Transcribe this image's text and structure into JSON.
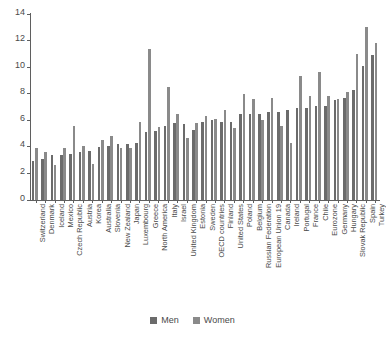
{
  "chart_data": {
    "type": "bar",
    "title": "",
    "subtitle": "",
    "xlabel": "",
    "ylabel": "",
    "ylim": [
      0,
      14
    ],
    "yticks": [
      0,
      2,
      4,
      6,
      8,
      10,
      12,
      14
    ],
    "grid": false,
    "legend_position": "bottom",
    "categories": [
      "Switzerland",
      "Denmark",
      "Iceland",
      "Mexico",
      "Czech Republic",
      "Austria",
      "Korea",
      "Australia",
      "Slovenia",
      "New Zealand",
      "Japan",
      "Luxembourg",
      "Greece",
      "North America",
      "Italy",
      "Israel",
      "United Kingdom",
      "Estonia",
      "Sweden",
      "OECD countries",
      "Finland",
      "United States",
      "Poland",
      "Belgium",
      "Russian Federation",
      "European Union 19",
      "Canada",
      "Ireland",
      "Portugal",
      "France",
      "Chile",
      "Eurozone",
      "Germany",
      "Hungary",
      "Slovak Republic",
      "Spain",
      "Turkey"
    ],
    "series": [
      {
        "name": "Men",
        "color": "#6b6b6b",
        "values": [
          2.9,
          3.1,
          3.4,
          3.4,
          3.5,
          3.6,
          3.7,
          4.0,
          4.1,
          4.2,
          4.2,
          4.3,
          5.1,
          5.2,
          5.6,
          5.8,
          5.7,
          5.3,
          5.9,
          6.0,
          5.9,
          5.9,
          6.5,
          6.5,
          6.5,
          6.6,
          6.6,
          6.8,
          6.9,
          6.9,
          7.1,
          7.1,
          7.5,
          7.7,
          8.3,
          10.1,
          10.9
        ]
      },
      {
        "name": "Women",
        "color": "#8a8a8a",
        "values": [
          3.9,
          3.6,
          2.6,
          3.9,
          5.6,
          4.1,
          2.7,
          4.5,
          4.8,
          3.9,
          3.9,
          5.9,
          11.4,
          5.5,
          8.5,
          6.5,
          4.7,
          5.8,
          6.3,
          6.1,
          6.8,
          5.4,
          8.0,
          7.6,
          6.0,
          7.7,
          5.6,
          4.3,
          9.3,
          7.8,
          9.6,
          7.8,
          7.6,
          8.1,
          11.0,
          13.0,
          11.8
        ]
      }
    ]
  },
  "legend": {
    "items": [
      {
        "label": "Men",
        "color": "#6b6b6b"
      },
      {
        "label": "Women",
        "color": "#8a8a8a"
      }
    ]
  }
}
